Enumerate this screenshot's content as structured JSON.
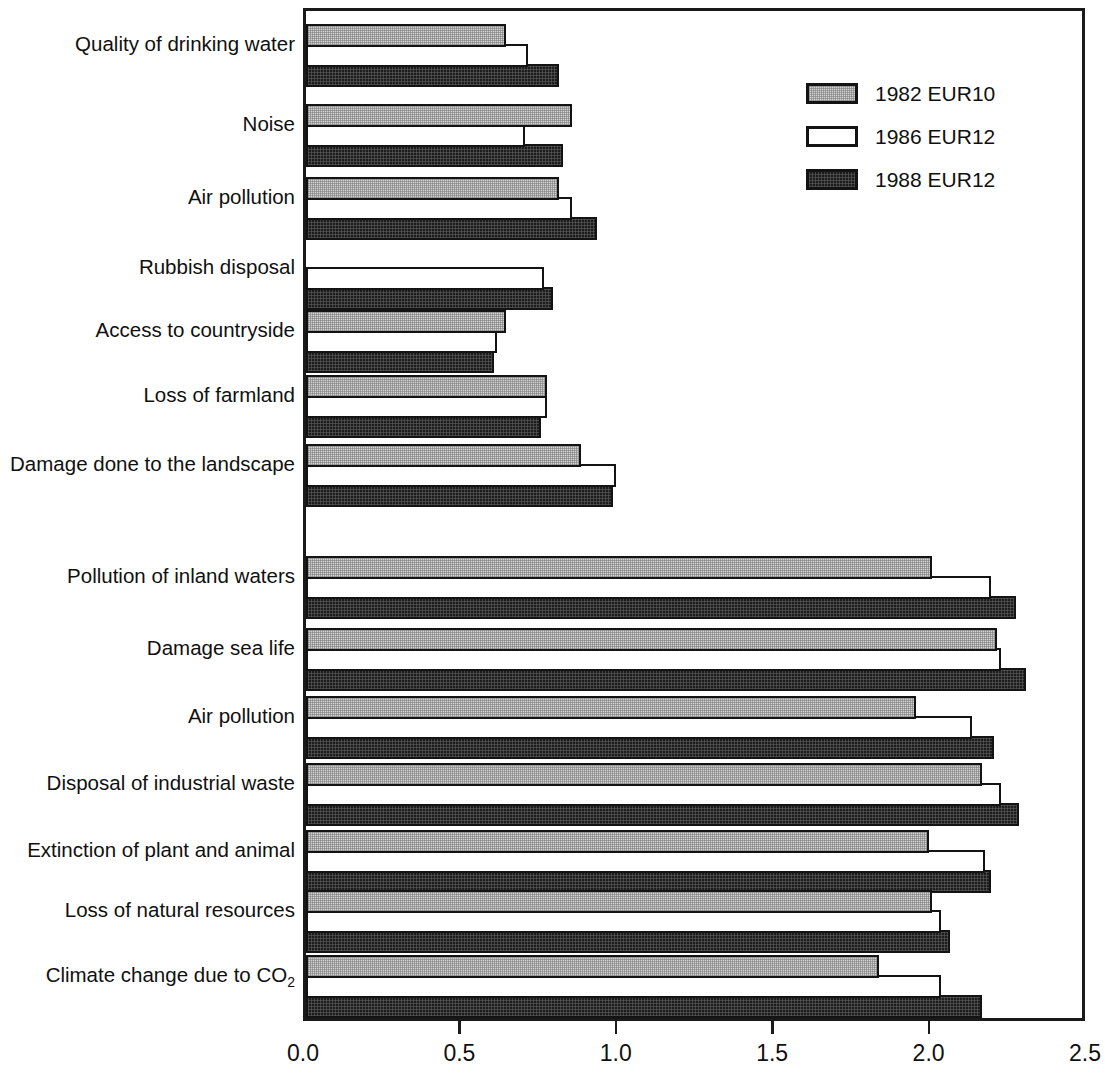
{
  "chart_data": {
    "type": "bar",
    "orientation": "horizontal",
    "title": "",
    "subtitle": "",
    "xlabel": "",
    "ylabel": "",
    "xlim": [
      0.0,
      2.5
    ],
    "xticks": [
      0.0,
      0.5,
      1.0,
      1.5,
      2.0,
      2.5
    ],
    "xtick_labels": [
      "0.0",
      "0.5",
      "1.0",
      "1.5",
      "2.0",
      "2.5"
    ],
    "grid": false,
    "legend_position": "top-right",
    "legend": [
      "1982 EUR10",
      "1986 EUR12",
      "1988 EUR12"
    ],
    "categories": [
      "Quality of drinking water",
      "Noise",
      "Air pollution",
      "Rubbish disposal",
      "Access to countryside",
      "Loss of farmland",
      "Damage done to the landscape",
      "Pollution of inland waters",
      "Damage sea life",
      "Air pollution",
      "Disposal of industrial waste",
      "Extinction of plant and animal",
      "Loss of natural resources",
      "Climate change due to CO2"
    ],
    "series": [
      {
        "name": "1982 EUR10",
        "swatch": "light-hatched",
        "values": [
          0.65,
          0.86,
          0.82,
          null,
          0.65,
          0.78,
          0.89,
          2.01,
          2.22,
          1.96,
          2.17,
          2.0,
          2.01,
          1.84
        ]
      },
      {
        "name": "1986 EUR12",
        "swatch": "white",
        "values": [
          0.72,
          0.71,
          0.86,
          0.77,
          0.62,
          0.78,
          1.0,
          2.2,
          2.23,
          2.14,
          2.23,
          2.18,
          2.04,
          2.04
        ]
      },
      {
        "name": "1988 EUR12",
        "swatch": "dark-hatched",
        "values": [
          0.82,
          0.83,
          0.94,
          0.8,
          0.61,
          0.76,
          0.99,
          2.28,
          2.31,
          2.21,
          2.29,
          2.2,
          2.07,
          2.17
        ]
      }
    ]
  },
  "axis": {
    "tick_labels": [
      "0.0",
      "0.5",
      "1.0",
      "1.5",
      "2.0",
      "2.5"
    ]
  },
  "categories": [
    {
      "label": "Quality of drinking water",
      "has_sub": false
    },
    {
      "label": "Noise",
      "has_sub": false
    },
    {
      "label": "Air pollution",
      "has_sub": false
    },
    {
      "label": "Rubbish disposal",
      "has_sub": false
    },
    {
      "label": "Access to countryside",
      "has_sub": false
    },
    {
      "label": "Loss of farmland",
      "has_sub": false
    },
    {
      "label": "Damage done to the landscape",
      "has_sub": false
    },
    {
      "label": "Pollution of inland waters",
      "has_sub": false
    },
    {
      "label": "Damage sea life",
      "has_sub": false
    },
    {
      "label": "Air pollution",
      "has_sub": false
    },
    {
      "label": "Disposal of industrial waste",
      "has_sub": false
    },
    {
      "label": "Extinction of plant and animal",
      "has_sub": false
    },
    {
      "label": "Loss of natural resources",
      "has_sub": false
    },
    {
      "label": "Climate change due to CO",
      "has_sub": true,
      "sub": "2"
    }
  ],
  "legend": {
    "items": [
      {
        "label": "1982 EUR10",
        "style": "s1982"
      },
      {
        "label": "1986 EUR12",
        "style": "s1986"
      },
      {
        "label": "1988 EUR12",
        "style": "s1988"
      }
    ]
  },
  "colors": {
    "frame": "#1a1a1a",
    "bar_outline": "#131313",
    "series_1982_fill": "#d2d2d2",
    "series_1986_fill": "#ffffff",
    "series_1988_fill": "#1d1d1d",
    "background": "#ffffff",
    "text": "#101010"
  },
  "geometry": {
    "x0_px": 303,
    "x_max_px": 1085,
    "plot_top_px": 8,
    "plot_bottom_px": 1021,
    "group_tops_px": [
      24,
      104,
      177,
      247,
      310,
      375,
      444,
      556,
      628,
      696,
      763,
      830,
      890,
      955
    ],
    "bar_height_px": 20,
    "bar_pitch_px": 20
  }
}
